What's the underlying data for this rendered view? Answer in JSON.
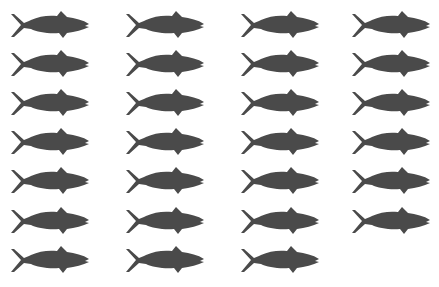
{
  "figure": {
    "fish_color": "#4a4a4a",
    "background": "#ffffff",
    "columns": 4,
    "rows": 7,
    "total_fish": 27,
    "row_counts": [
      4,
      4,
      4,
      4,
      4,
      4,
      3
    ],
    "caption": ""
  }
}
